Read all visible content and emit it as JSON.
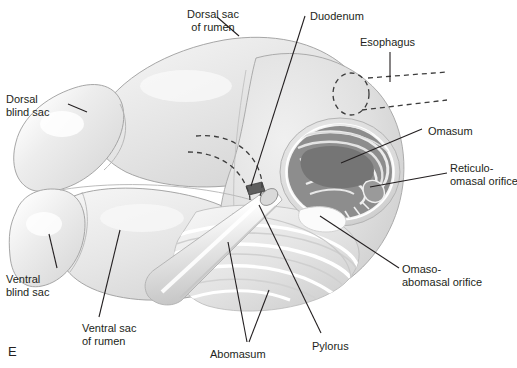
{
  "figure": {
    "panel_letter": "E",
    "type": "anatomical-illustration",
    "background_color": "#ffffff",
    "line_color": "#231f20",
    "palette": {
      "rumen_fill_light": "#e9e9e9",
      "rumen_fill_mid": "#dcdcdc",
      "rumen_outline": "#9a9a9a",
      "highlight": "#fbfbfb",
      "omasum_lamina": "#8a8a8a",
      "omasum_lamina_dark": "#6f6f6f",
      "omasum_gap": "#e4e4e4",
      "abomasum_fold_light": "#f2f2f2",
      "abomasum_fold_mid": "#d9d9d9",
      "duodenum_stub": "#5a5a5a"
    }
  },
  "labels": [
    {
      "id": "dorsal-sac-of-rumen",
      "text": "Dorsal sac\nof rumen",
      "x": 176,
      "y": 8,
      "align": "center",
      "width": 74
    },
    {
      "id": "duodenum",
      "text": "Duodenum",
      "x": 310,
      "y": 10,
      "align": "left",
      "width": 64
    },
    {
      "id": "esophagus",
      "text": "Esophagus",
      "x": 360,
      "y": 36,
      "align": "left",
      "width": 64
    },
    {
      "id": "dorsal-blind-sac",
      "text": "Dorsal\nblind sac",
      "x": 6,
      "y": 93,
      "align": "left",
      "width": 58
    },
    {
      "id": "omasum",
      "text": "Omasum",
      "x": 428,
      "y": 125,
      "align": "left",
      "width": 56
    },
    {
      "id": "reticulo-omasal-orifice",
      "text": "Reticulo-\nomasal orifice",
      "x": 450,
      "y": 162,
      "align": "left",
      "width": 66
    },
    {
      "id": "ventral-blind-sac",
      "text": "Ventral\nblind sac",
      "x": 6,
      "y": 273,
      "align": "left",
      "width": 58
    },
    {
      "id": "omaso-abomasal-orifice",
      "text": "Omaso-\nabomasal orifice",
      "x": 402,
      "y": 263,
      "align": "left",
      "width": 90
    },
    {
      "id": "ventral-sac-of-rumen",
      "text": "Ventral sac\nof rumen",
      "x": 82,
      "y": 322,
      "align": "left",
      "width": 72
    },
    {
      "id": "abomasum",
      "text": "Abomasum",
      "x": 210,
      "y": 348,
      "align": "left",
      "width": 62
    },
    {
      "id": "pylorus",
      "text": "Pylorus",
      "x": 312,
      "y": 340,
      "align": "left",
      "width": 46
    }
  ],
  "leader_lines": [
    {
      "id": "leader-dorsal-sac-of-rumen",
      "points": "239,36 217,17"
    },
    {
      "id": "leader-duodenum",
      "points": "251,186 305,16"
    },
    {
      "id": "leader-esophagus",
      "points": "390,52 390,82"
    },
    {
      "id": "leader-dorsal-blind-sac",
      "points": "68,104 87,112"
    },
    {
      "id": "leader-omasum",
      "points": "341,163 422,129"
    },
    {
      "id": "leader-reticulo-omasal-orifice",
      "points": "370,187 447,173"
    },
    {
      "id": "leader-ventral-blind-sac",
      "points": "49,234 57,268"
    },
    {
      "id": "leader-omaso-abomasal-orifice",
      "points": "320,216 399,268"
    },
    {
      "id": "leader-ventral-sac-of-rumen",
      "points": "120,230 99,317"
    },
    {
      "id": "leader-abomasum-a",
      "points": "228,242 247,342"
    },
    {
      "id": "leader-abomasum-b",
      "points": "269,290 249,342"
    },
    {
      "id": "leader-pylorus",
      "points": "259,205 321,333"
    }
  ],
  "dashed_features": [
    {
      "id": "esophagus-dashed-circle",
      "shape": "ellipse",
      "cx": 351,
      "cy": 94,
      "rx": 18,
      "ry": 21
    },
    {
      "id": "esophagus-dashed-line-upper",
      "shape": "line",
      "points": "368,78 447,72"
    },
    {
      "id": "esophagus-dashed-line-lower",
      "shape": "line",
      "points": "362,110 447,100"
    },
    {
      "id": "reticulum-dashed-outline-upper",
      "shape": "path",
      "d": "M196,136 C225,133 248,146 258,168 C263,180 263,188 260,196"
    },
    {
      "id": "reticulum-dashed-outline-lower",
      "shape": "path",
      "d": "M188,152 C214,152 236,164 245,184 C249,192 250,196 250,200"
    }
  ]
}
